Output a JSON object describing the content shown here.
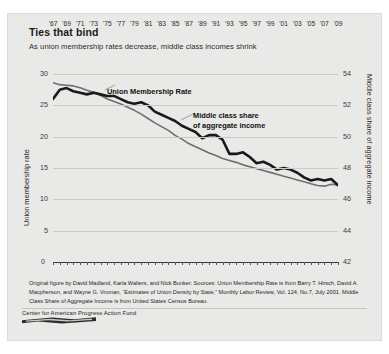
{
  "title": "Ties that bind",
  "subtitle": "As union membership rates decrease, middle class incomes shrink",
  "axis": {
    "left_label": "Union membership rate",
    "right_label": "Middle class share of aggregate income",
    "left_ticks": [
      "30",
      "25",
      "20",
      "15",
      "10",
      "5",
      "0"
    ],
    "right_ticks": [
      "54",
      "52",
      "50",
      "48",
      "46",
      "44",
      "42"
    ],
    "x_zero_label": "0",
    "x_right_label": "42"
  },
  "annotations": {
    "union": "Union Membership Rate",
    "middle_line1": "Middle class share",
    "middle_line2": "of aggregate income"
  },
  "footnote": "Original figure by David Madland, Karla Walters, and Nick Bunker. Sources: Union Membership Rate is from Barry T. Hirsch, David A. Macpherson, and Wayne G. Vroman, “Estimates of Union Density by State,” Monthly Labor Review, Vol. 124, No.7, July 2001. Middle Class Share of Aggregate Income is from United States Census Bureau.",
  "footer": {
    "org": "Center for American Progress Action Fund"
  },
  "colors": {
    "card_bg": "#e9e9e7",
    "union_line": "#6e6e6c",
    "middle_line": "#1a1a1a",
    "grid": "#c9c9c6"
  },
  "chart_data": {
    "type": "line",
    "title": "Ties that bind",
    "subtitle": "As union membership rates decrease, middle class incomes shrink",
    "xlabel": "",
    "ylabel": "Union membership rate",
    "y2label": "Middle class share of aggregate income",
    "ylim": [
      0,
      30
    ],
    "y2lim": [
      42,
      54
    ],
    "yticks": [
      0,
      5,
      10,
      15,
      20,
      25,
      30
    ],
    "y2ticks": [
      42,
      44,
      46,
      48,
      50,
      52,
      54
    ],
    "grid": true,
    "legend": "inline-annotations",
    "x": [
      1967,
      1968,
      1969,
      1970,
      1971,
      1972,
      1973,
      1974,
      1975,
      1976,
      1977,
      1978,
      1979,
      1980,
      1981,
      1982,
      1983,
      1984,
      1985,
      1986,
      1987,
      1988,
      1989,
      1990,
      1991,
      1992,
      1993,
      1994,
      1995,
      1996,
      1997,
      1998,
      1999,
      2000,
      2001,
      2002,
      2003,
      2004,
      2005,
      2006,
      2007,
      2008,
      2009
    ],
    "xtick_labels": [
      "'67",
      "'69",
      "'71",
      "'73",
      "'75",
      "'77",
      "'79",
      "'81",
      "'83",
      "'85",
      "'87",
      "'89",
      "'91",
      "'93",
      "'95",
      "'97",
      "'99",
      "'01",
      "'03",
      "'05",
      "'07",
      "'09"
    ],
    "series": [
      {
        "name": "Union Membership Rate",
        "axis": "left",
        "color": "#6e6e6c",
        "values": [
          28.6,
          28.3,
          28.2,
          28.1,
          27.8,
          27.4,
          27.1,
          26.6,
          26.0,
          25.6,
          25.2,
          24.7,
          24.2,
          23.6,
          22.9,
          22.2,
          21.6,
          21.0,
          20.2,
          19.6,
          18.9,
          18.4,
          17.9,
          17.4,
          17.0,
          16.5,
          16.2,
          15.9,
          15.5,
          15.2,
          14.9,
          14.6,
          14.3,
          14.0,
          13.7,
          13.4,
          13.1,
          12.8,
          12.5,
          12.2,
          12.1,
          12.4,
          12.3
        ]
      },
      {
        "name": "Middle class share of aggregate income",
        "axis": "right",
        "color": "#1a1a1a",
        "values": [
          52.4,
          53.0,
          53.1,
          52.9,
          52.8,
          52.7,
          52.8,
          52.7,
          52.6,
          52.6,
          52.4,
          52.2,
          52.1,
          52.2,
          52.0,
          51.6,
          51.4,
          51.2,
          51.0,
          50.7,
          50.5,
          50.3,
          49.9,
          50.1,
          50.1,
          49.8,
          48.9,
          48.9,
          49.0,
          48.7,
          48.3,
          48.4,
          48.2,
          47.9,
          48.0,
          47.9,
          47.7,
          47.4,
          47.2,
          47.3,
          47.2,
          47.3,
          46.9
        ]
      }
    ]
  }
}
